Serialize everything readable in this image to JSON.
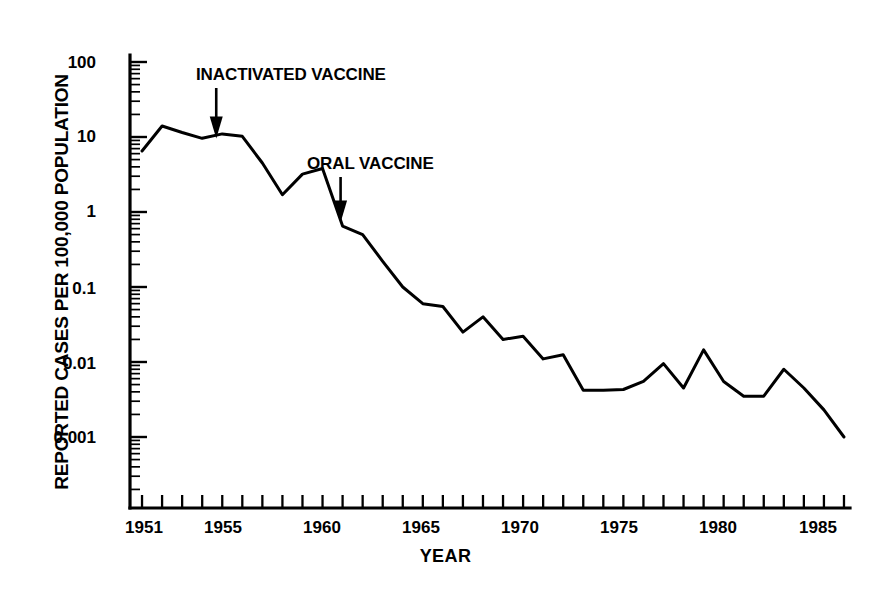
{
  "chart_data": {
    "type": "line",
    "title": "",
    "xlabel": "YEAR",
    "ylabel": "REPORTED CASES PER 100,000 POPULATION",
    "yscale": "log",
    "ylim": [
      0.001,
      100
    ],
    "xlim": [
      1950.4,
      1986.3
    ],
    "grid": false,
    "legend": null,
    "ytick_labels": [
      "100",
      "10",
      "1",
      "0.1",
      "0.01",
      "0.001"
    ],
    "ytick_values": [
      100,
      10,
      1,
      0.1,
      0.01,
      0.001
    ],
    "xtick_labels": [
      "1951",
      "1955",
      "1960",
      "1965",
      "1970",
      "1975",
      "1980",
      "1985"
    ],
    "xtick_values": [
      1951,
      1955,
      1960,
      1965,
      1970,
      1975,
      1980,
      1985
    ],
    "x": [
      1951,
      1952,
      1953,
      1954,
      1955,
      1956,
      1957,
      1958,
      1959,
      1960,
      1961,
      1962,
      1963,
      1964,
      1965,
      1966,
      1967,
      1968,
      1969,
      1970,
      1971,
      1972,
      1973,
      1974,
      1975,
      1976,
      1977,
      1978,
      1979,
      1980,
      1981,
      1982,
      1983,
      1984,
      1985,
      1986
    ],
    "values": [
      6.5,
      14.0,
      11.5,
      9.6,
      11.0,
      10.2,
      4.5,
      1.7,
      3.2,
      3.8,
      0.65,
      0.5,
      0.22,
      0.1,
      0.06,
      0.055,
      0.025,
      0.04,
      0.02,
      0.022,
      0.011,
      0.0125,
      0.0042,
      0.0042,
      0.0043,
      0.0055,
      0.0095,
      0.0045,
      0.0145,
      0.0055,
      0.0035,
      0.0035,
      0.008,
      0.0045,
      0.0023,
      0.001
    ],
    "series_name": "Reported poliomyelitis cases",
    "annotations": [
      {
        "name": "inactivated-vaccine",
        "text": "INACTIVATED VACCINE",
        "x_year": 1954.7,
        "y_value": 9.0
      },
      {
        "name": "oral-vaccine",
        "text": "ORAL VACCINE",
        "x_year": 1960.9,
        "y_value": 0.68
      }
    ],
    "line_color": "#000000",
    "background_color": "#ffffff"
  }
}
